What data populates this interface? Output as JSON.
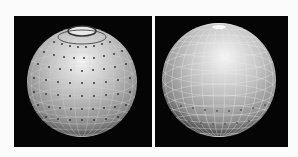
{
  "figure": {
    "background": "#fbfbfb",
    "panels": [
      {
        "id": "left",
        "description": "Shaded gray sphere with lat/long grid and dense dot markers, top cap ring",
        "panel_bg": "#050505",
        "sphere": {
          "cx": 68,
          "cy": 66,
          "r": 55,
          "highlight": "#f2f2f2",
          "mid": "#a8a8a8",
          "shadow": "#3a3a3a"
        },
        "markers": "dense",
        "top_cap_ring": true
      },
      {
        "id": "right",
        "description": "Shaded gray sphere with fine lat/long grid, sparse dot markers in lower band",
        "panel_bg": "#050505",
        "sphere": {
          "cx": 64,
          "cy": 64,
          "r": 57,
          "highlight": "#f5f5f5",
          "mid": "#b0b0b0",
          "shadow": "#3a3a3a"
        },
        "markers": "sparse-lower",
        "top_cap_ring": false
      }
    ]
  }
}
